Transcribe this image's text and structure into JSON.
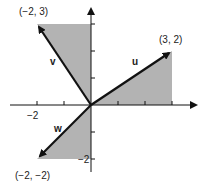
{
  "diagram": {
    "type": "vector-plot",
    "origin": [
      0,
      0
    ],
    "vectors": [
      {
        "name": "u",
        "label": "u",
        "tip": [
          3,
          2
        ],
        "tip_label": "(3, 2)"
      },
      {
        "name": "v",
        "label": "v",
        "tip": [
          -2,
          3
        ],
        "tip_label": "(−2, 3)"
      },
      {
        "name": "w",
        "label": "w",
        "tip": [
          -2,
          -2
        ],
        "tip_label": "(−2, −2)"
      }
    ],
    "axis_labels": {
      "x_neg2": "−2",
      "y_neg2": "−2"
    },
    "fill_color": "#b3b3b3",
    "line_color": "#111111"
  }
}
